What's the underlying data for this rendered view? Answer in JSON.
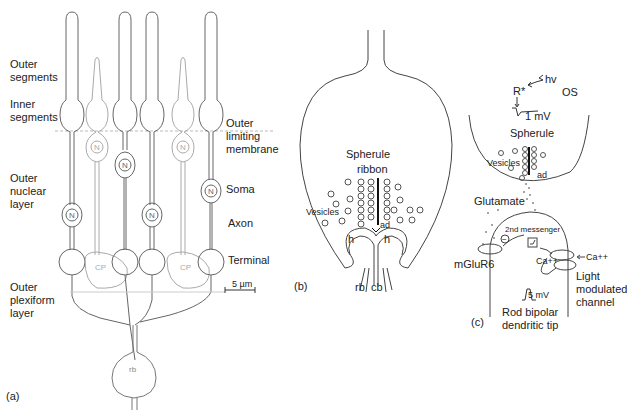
{
  "figure": {
    "panels": [
      {
        "id": "a",
        "tag": "(a)",
        "labels": {
          "outer_segments": [
            "Outer",
            "segments"
          ],
          "inner_segments": [
            "Inner",
            "segments"
          ],
          "outer_limiting_membrane": [
            "Outer",
            "limiting",
            "membrane"
          ],
          "outer_nuclear_layer": [
            "Outer",
            "nuclear",
            "layer"
          ],
          "soma": "Soma",
          "axon": "Axon",
          "terminal": "Terminal",
          "outer_plexiform_layer": [
            "Outer",
            "plexiform",
            "layer"
          ],
          "scale_bar": "5 µm",
          "nucleus": "N",
          "cone_pedicle": "CP",
          "rod_bipolar": "rb"
        }
      },
      {
        "id": "b",
        "tag": "(b)",
        "labels": {
          "spherule": "Spherule",
          "ribbon": "ribbon",
          "vesicles": "Vesicles",
          "arciform_density": "ad",
          "horizontal_left": "h",
          "horizontal_right": "h",
          "rod_bipolar": "rb",
          "cone_bipolar": "cb"
        }
      },
      {
        "id": "c",
        "tag": "(c)",
        "labels": {
          "photon": "hv",
          "rhodopsin": "R*",
          "outer_segment": "OS",
          "rod_voltage": "1 mV",
          "spherule": "Spherule",
          "vesicles": "Vesicles",
          "arciform_density": "ad",
          "glutamate": "Glutamate",
          "second_messenger": "2nd messenger",
          "minus": "−",
          "receptor": "mGluR6",
          "calcium_in": "Ca++",
          "calcium_out": "Ca++",
          "light_modulated_channel": [
            "Light",
            "modulated",
            "channel"
          ],
          "bipolar_voltage": "5 mV",
          "bipolar_tip": [
            "Rod bipolar",
            "dendritic tip"
          ]
        }
      }
    ]
  }
}
